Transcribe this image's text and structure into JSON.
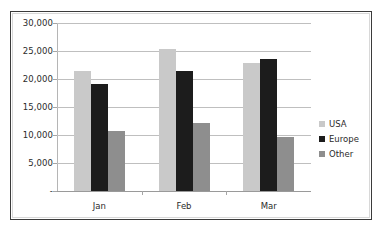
{
  "chart_data": {
    "type": "bar",
    "title": "",
    "subtitle": "",
    "xlabel": "",
    "ylabel": "",
    "categories": [
      "Jan",
      "Feb",
      "Mar"
    ],
    "series": [
      {
        "name": "USA",
        "color": "#c9c9c9",
        "values": [
          21500,
          25300,
          22800
        ]
      },
      {
        "name": "Europe",
        "color": "#1c1c1c",
        "values": [
          19100,
          21400,
          23600
        ]
      },
      {
        "name": "Other",
        "color": "#8e8e8e",
        "values": [
          10700,
          12100,
          9700
        ]
      }
    ],
    "ylim": [
      0,
      30000
    ],
    "yticks": [
      0,
      5000,
      10000,
      15000,
      20000,
      25000,
      30000
    ],
    "ytick_labels": [
      "-",
      "5,000",
      "10,000",
      "15,000",
      "20,000",
      "25,000",
      "30,000"
    ],
    "grid": true,
    "legend_position": "right"
  },
  "legend": {
    "items": [
      {
        "label": "USA"
      },
      {
        "label": "Europe"
      },
      {
        "label": "Other"
      }
    ]
  }
}
